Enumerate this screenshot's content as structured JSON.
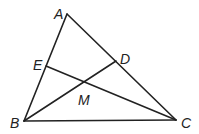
{
  "diagram": {
    "type": "triangle-with-cevians",
    "points": {
      "A": {
        "label": "A",
        "x": 67,
        "y": 14,
        "lx": 54,
        "ly": 19
      },
      "B": {
        "label": "B",
        "x": 24,
        "y": 121,
        "lx": 10,
        "ly": 128
      },
      "C": {
        "label": "C",
        "x": 176,
        "y": 120,
        "lx": 181,
        "ly": 128
      },
      "D": {
        "label": "D",
        "x": 116,
        "y": 61,
        "lx": 120,
        "ly": 64
      },
      "E": {
        "label": "E",
        "x": 46,
        "y": 66,
        "lx": 33,
        "ly": 70
      },
      "M": {
        "label": "M",
        "x": 84,
        "y": 82,
        "lx": 78,
        "ly": 105
      }
    },
    "segments": [
      {
        "from": "A",
        "to": "B"
      },
      {
        "from": "B",
        "to": "C"
      },
      {
        "from": "A",
        "to": "C"
      },
      {
        "from": "B",
        "to": "D"
      },
      {
        "from": "E",
        "to": "C"
      }
    ]
  }
}
